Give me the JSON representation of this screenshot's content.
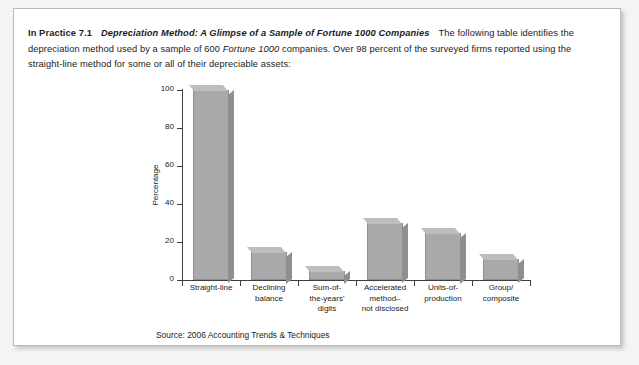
{
  "panel": {
    "label": "In Practice 7.1",
    "title": "Depreciation Method: A Glimpse of a Sample of Fortune 1000 Companies",
    "body_1": "The following table identifies the depreciation method used by a sample of 600 ",
    "body_italic": "Fortune 1000",
    "body_2": " companies. Over 98 percent of the surveyed firms reported using the straight-line method for some or all of their depreciable assets:",
    "source": "Source: 2006 Accounting Trends & Techniques"
  },
  "chart_data": {
    "type": "bar",
    "title": "",
    "xlabel": "",
    "ylabel": "Percentage",
    "ylim": [
      0,
      100
    ],
    "yticks": [
      0,
      20,
      40,
      60,
      80,
      100
    ],
    "ytick_labels": [
      "0",
      "20",
      "40",
      "60",
      "80",
      "100"
    ],
    "grid": false,
    "legend": false,
    "categories": [
      "Straight-line",
      "Declining\nbalance",
      "Sum-of-\nthe-years'\ndigits",
      "Accelerated\nmethod–\nnot disclosed",
      "Units-of-\nproduction",
      "Group/\ncomposite"
    ],
    "values": [
      100,
      15,
      5,
      30,
      25,
      11
    ],
    "bar_color": "#a9a9a9",
    "bar_edge_color": "#8f8f8f",
    "axis_color": "#3f3f3f"
  }
}
